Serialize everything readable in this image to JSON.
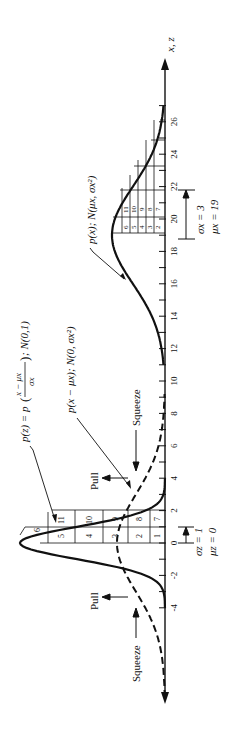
{
  "figure": {
    "orientation": "rotated 90 degrees counter-clockwise",
    "axis_label": "x, z",
    "axis_ticks": [
      "-4",
      "-2",
      "0",
      "2",
      "4",
      "6",
      "8",
      "10",
      "12",
      "14",
      "16",
      "18",
      "20",
      "22",
      "24",
      "26"
    ],
    "labels": {
      "standard_normal": "p(z) = p((x − μx)/σx); N(0,1)",
      "standard_normal_prefix": "p(z) = p",
      "standard_normal_num": "x − μx",
      "standard_normal_den": "σx",
      "standard_normal_suffix": "; N(0,1)",
      "centered": "p(x − μx); N(0, σx²)",
      "original": "p(x); N(μx, σx²)",
      "pull_top": "Pull",
      "pull_bottom": "Pull",
      "squeeze_top": "Squeeze",
      "squeeze_bottom": "Squeeze",
      "sigma_z": "σz = 1",
      "mu_z": "μz = 0",
      "sigma_x": "σx = 3",
      "mu_x": "μx = 19"
    },
    "left_cells": [
      "1",
      "7",
      "2",
      "8",
      "3",
      "9",
      "4",
      "10",
      "5",
      "11",
      "6"
    ],
    "right_cells": [
      "2",
      "3",
      "4",
      "5",
      "6",
      "7",
      "8",
      "9",
      "10",
      "11"
    ]
  },
  "chart_data": {
    "type": "line",
    "title": "",
    "xlabel": "x, z",
    "ylabel": "",
    "xlim": [
      -5,
      28
    ],
    "series": [
      {
        "name": "p(z); N(0,1)",
        "style": "solid",
        "mean": 0,
        "sd": 1,
        "x_range": [
          -4,
          4
        ]
      },
      {
        "name": "p(x − μx); N(0, σx²)",
        "style": "dashed",
        "mean": 0,
        "sd": 3,
        "x_range": [
          -9,
          9
        ]
      },
      {
        "name": "p(x); N(μx, σx²)",
        "style": "solid",
        "mean": 19,
        "sd": 3,
        "x_range": [
          11,
          27
        ]
      }
    ],
    "annotations": [
      "Pull",
      "Pull",
      "Squeeze",
      "Squeeze",
      "σz = 1",
      "μz = 0",
      "σx = 3",
      "μx = 19"
    ]
  }
}
